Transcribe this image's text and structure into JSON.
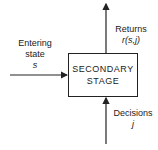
{
  "diagram": {
    "box": {
      "line1": "SECONDARY",
      "line2": "STAGE"
    },
    "input": {
      "line1": "Entering",
      "line2": "state",
      "symbol": "s"
    },
    "output": {
      "line1": "Returns",
      "symbol": "r(s,j)"
    },
    "decision": {
      "line1": "Decisions",
      "symbol": "j"
    }
  }
}
